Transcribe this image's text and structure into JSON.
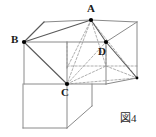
{
  "figure": {
    "caption": "図4",
    "stroke_color": "#8a8a8a",
    "hidden_stroke_color": "#9a9a9a",
    "solid_edge_color": "#5a5a5a",
    "vertex_color": "#000000",
    "background_color": "#ffffff",
    "labels": {
      "a": "A",
      "b": "B",
      "c": "C",
      "d": "D"
    },
    "vertices": {
      "A": {
        "x": 91,
        "y": 20
      },
      "B": {
        "x": 24,
        "y": 42
      },
      "C": {
        "x": 67,
        "y": 84
      },
      "D": {
        "x": 106,
        "y": 42
      }
    },
    "geometry": {
      "type": "cuboid-net-with-inscribed-pyramid",
      "solid_edges": [
        {
          "name": "top-back-left",
          "points": "24,42 44,22"
        },
        {
          "name": "top-back-edge",
          "points": "44,22 91,20"
        },
        {
          "name": "top-right-to-corner",
          "points": "91,20 137,22"
        },
        {
          "name": "right-vertical",
          "points": "137,22 137,78"
        },
        {
          "name": "top-face-front-right",
          "points": "91,20 106,42"
        },
        {
          "name": "front-top-horizontal",
          "points": "24,42 106,42"
        },
        {
          "name": "front-left-vertical",
          "points": "24,42 24,84"
        },
        {
          "name": "front-bottom-horizontal",
          "points": "24,84 106,84"
        },
        {
          "name": "right-face-lower-diagonal",
          "points": "106,84 137,78"
        },
        {
          "name": "right-face-upper-diagonal",
          "points": "106,42 137,22"
        },
        {
          "name": "mid-vertical-C",
          "points": "67,84 67,42"
        },
        {
          "name": "net-left-vertical",
          "points": "23,84 23,128"
        },
        {
          "name": "net-bottom-horizontal",
          "points": "23,128 67,128"
        },
        {
          "name": "net-right-vertical",
          "points": "67,84 67,128"
        },
        {
          "name": "flap-vertical",
          "points": "92,84 92,106"
        },
        {
          "name": "flap-diagonal",
          "points": "92,106 67,128"
        }
      ],
      "pyramid_solid_edges": [
        {
          "name": "A-to-B",
          "points": "91,20 24,42"
        },
        {
          "name": "B-to-C",
          "points": "24,42 67,84"
        },
        {
          "name": "A-to-D",
          "points": "91,20 106,42"
        },
        {
          "name": "D-to-right-corner",
          "points": "106,42 137,78"
        }
      ],
      "hidden_edges": [
        {
          "name": "A-to-C",
          "points": "91,20 67,84"
        },
        {
          "name": "A-to-interior-front",
          "points": "91,20 67,68"
        },
        {
          "name": "A-to-mid-right",
          "points": "91,20 106,66"
        },
        {
          "name": "A-to-far-right",
          "points": "91,20 137,78"
        },
        {
          "name": "C-to-interior",
          "points": "67,84 106,66"
        },
        {
          "name": "C-to-far-right",
          "points": "67,84 137,78"
        },
        {
          "name": "C-to-D",
          "points": "67,84 106,42"
        },
        {
          "name": "hidden-back-horizontal",
          "points": "67,66 137,66"
        },
        {
          "name": "hidden-back-vertical",
          "points": "106,42 106,66"
        },
        {
          "name": "hidden-back-left-vertical",
          "points": "67,42 67,68"
        },
        {
          "name": "hidden-back-diagonal",
          "points": "106,66 137,78"
        }
      ]
    }
  }
}
